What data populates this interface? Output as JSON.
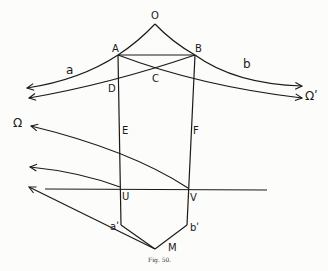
{
  "figure": {
    "caption": "Fig. 50.",
    "points": {
      "O": "O",
      "A": "A",
      "B": "B",
      "C": "C",
      "D": "D",
      "E": "E",
      "F": "F",
      "U": "U",
      "V": "V",
      "a_prime": "aʹ",
      "b_prime": "bʹ",
      "M": "M"
    },
    "curve_labels": {
      "a": "a",
      "b": "b"
    },
    "infinity_labels": {
      "omega_left": "Ω",
      "omega_right": "Ωʹ"
    }
  }
}
